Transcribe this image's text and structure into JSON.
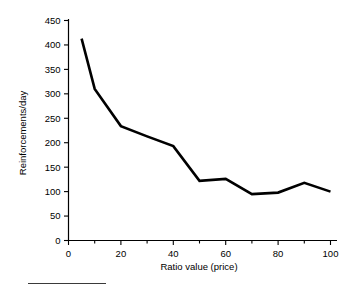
{
  "chart_data": {
    "type": "line",
    "title": "",
    "xlabel": "Ratio value (price)",
    "ylabel": "Reinforcements/day",
    "xlim": [
      0,
      100
    ],
    "ylim": [
      0,
      450
    ],
    "grid": false,
    "legend": false,
    "x_ticks": [
      0,
      20,
      40,
      60,
      80,
      100
    ],
    "x_tick_labels": [
      "0",
      "20",
      "40",
      "60",
      "80",
      "100"
    ],
    "x_minor_ticks": [
      10,
      30,
      50,
      70,
      90
    ],
    "y_ticks": [
      0,
      50,
      100,
      150,
      200,
      250,
      300,
      350,
      400,
      450
    ],
    "y_tick_labels": [
      "0",
      "50",
      "100",
      "150",
      "200",
      "250",
      "300",
      "350",
      "400",
      "450"
    ],
    "series": [
      {
        "name": "Reinforcements/day",
        "color": "#000000",
        "x": [
          5,
          10,
          20,
          30,
          40,
          50,
          60,
          70,
          80,
          90,
          100
        ],
        "values": [
          413,
          310,
          234,
          213,
          193,
          122,
          126,
          95,
          98,
          118,
          100
        ]
      }
    ]
  },
  "figure": {
    "footer_rule": true
  }
}
